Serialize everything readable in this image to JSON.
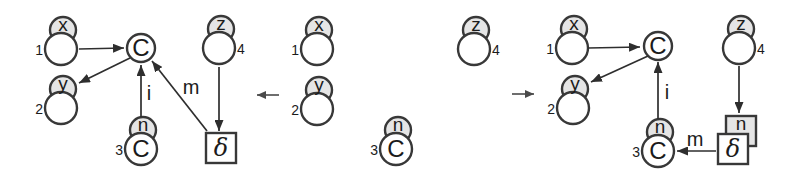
{
  "figure": {
    "width": 794,
    "height": 176,
    "colors": {
      "background": "#ffffff",
      "node_stroke": "#383838",
      "node_fill": "#ffffff",
      "shade_fill": "#e5e5e5",
      "edge_stroke": "#2e2e2e",
      "text": "#1b1b1b",
      "rule_arrow": "#4a4a4a"
    },
    "rule_arrows": [
      {
        "name": "rule-arrow-left",
        "direction": "left",
        "x1": 279,
        "y1": 95,
        "x2": 257,
        "y2": 95
      },
      {
        "name": "rule-arrow-right",
        "direction": "right",
        "x1": 512,
        "y1": 94,
        "x2": 534,
        "y2": 94
      }
    ],
    "graphs": [
      {
        "name": "lhs-graph",
        "nodes": [
          {
            "type": "port",
            "cx": 61,
            "cy": 49,
            "top_label": "x",
            "number": "1",
            "number_side": "left"
          },
          {
            "type": "port",
            "cx": 61,
            "cy": 108,
            "top_label": "y",
            "number": "2",
            "number_side": "left"
          },
          {
            "type": "port",
            "cx": 141,
            "cy": 149,
            "top_label": "n",
            "inner_label": "C",
            "number": "3",
            "number_side": "left"
          },
          {
            "type": "port",
            "cx": 219,
            "cy": 48,
            "top_label": "z",
            "number": "4",
            "number_side": "right"
          },
          {
            "type": "circle",
            "cx": 141,
            "cy": 48,
            "label": "C"
          },
          {
            "type": "box",
            "cx": 221,
            "cy": 148,
            "label": "δ"
          }
        ],
        "edges": [
          {
            "x1": 79,
            "y1": 49,
            "x2": 124,
            "y2": 48
          },
          {
            "x1": 130,
            "y1": 58,
            "x2": 79,
            "y2": 83
          },
          {
            "x1": 141,
            "y1": 117,
            "x2": 141,
            "y2": 65,
            "label": "i",
            "lx": 149,
            "ly": 100
          },
          {
            "x1": 207,
            "y1": 131,
            "x2": 152,
            "y2": 61,
            "label": "m",
            "lx": 191,
            "ly": 94
          },
          {
            "x1": 219,
            "y1": 67,
            "x2": 219,
            "y2": 131
          }
        ]
      },
      {
        "name": "interface-graph",
        "nodes": [
          {
            "type": "port",
            "cx": 317,
            "cy": 49,
            "top_label": "x",
            "number": "1",
            "number_side": "left"
          },
          {
            "type": "port",
            "cx": 317,
            "cy": 109,
            "top_label": "y",
            "number": "2",
            "number_side": "left"
          },
          {
            "type": "port",
            "cx": 396,
            "cy": 149,
            "top_label": "n",
            "inner_label": "C",
            "number": "3",
            "number_side": "left"
          },
          {
            "type": "port",
            "cx": 474,
            "cy": 49,
            "top_label": "z",
            "number": "4",
            "number_side": "right"
          }
        ],
        "edges": []
      },
      {
        "name": "rhs-graph",
        "nodes": [
          {
            "type": "port",
            "cx": 572,
            "cy": 48,
            "top_label": "x",
            "number": "1",
            "number_side": "left"
          },
          {
            "type": "port",
            "cx": 573,
            "cy": 108,
            "top_label": "y",
            "number": "2",
            "number_side": "left"
          },
          {
            "type": "port",
            "cx": 658,
            "cy": 151,
            "top_label": "n",
            "inner_label": "C",
            "number": "3",
            "number_side": "left"
          },
          {
            "type": "port",
            "cx": 739,
            "cy": 48,
            "top_label": "z",
            "number": "4",
            "number_side": "right"
          },
          {
            "type": "circle",
            "cx": 658,
            "cy": 46,
            "label": "C"
          },
          {
            "type": "box2",
            "cx": 733,
            "cy": 149,
            "label": "δ",
            "back_label": "n"
          }
        ],
        "edges": [
          {
            "x1": 588,
            "y1": 48,
            "x2": 640,
            "y2": 47
          },
          {
            "x1": 648,
            "y1": 56,
            "x2": 591,
            "y2": 82
          },
          {
            "x1": 658,
            "y1": 119,
            "x2": 658,
            "y2": 62,
            "label": "i",
            "lx": 667,
            "ly": 99
          },
          {
            "x1": 716,
            "y1": 151,
            "x2": 677,
            "y2": 151,
            "label": "m",
            "lx": 695,
            "ly": 146
          },
          {
            "x1": 739,
            "y1": 66,
            "x2": 739,
            "y2": 113
          }
        ]
      }
    ]
  }
}
